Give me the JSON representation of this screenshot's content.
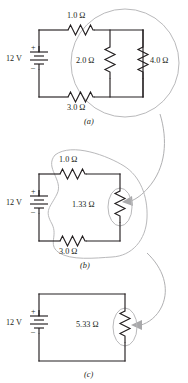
{
  "figure": {
    "colors": {
      "wire": "#231f20",
      "callout": "#b9b9bb",
      "background": "#ffffff"
    },
    "panels": [
      {
        "id": "a",
        "label": "(a)",
        "source": {
          "label": "12 V",
          "plus": "+",
          "minus": "–"
        },
        "components": [
          {
            "name": "r-series-top",
            "label": "1.0 Ω",
            "value": 1.0,
            "unit": "Ω",
            "orientation": "horizontal"
          },
          {
            "name": "r-parallel-left",
            "label": "2.0 Ω",
            "value": 2.0,
            "unit": "Ω",
            "orientation": "vertical"
          },
          {
            "name": "r-parallel-right",
            "label": "4.0 Ω",
            "value": 4.0,
            "unit": "Ω",
            "orientation": "vertical"
          },
          {
            "name": "r-series-bottom",
            "label": "3.0 Ω",
            "value": 3.0,
            "unit": "Ω",
            "orientation": "horizontal"
          }
        ],
        "highlight": {
          "shape": "circle",
          "encloses": "parallel-pair-2.0-and-4.0"
        }
      },
      {
        "id": "b",
        "label": "(b)",
        "source": {
          "label": "12 V",
          "plus": "+",
          "minus": "–"
        },
        "components": [
          {
            "name": "r-series-top",
            "label": "1.0 Ω",
            "value": 1.0,
            "unit": "Ω",
            "orientation": "horizontal"
          },
          {
            "name": "r-equivalent-parallel",
            "label": "1.33 Ω",
            "value": 1.33,
            "unit": "Ω",
            "orientation": "vertical"
          },
          {
            "name": "r-series-bottom",
            "label": "3.0 Ω",
            "value": 3.0,
            "unit": "Ω",
            "orientation": "horizontal"
          }
        ],
        "highlight": {
          "shape": "ellipse",
          "encloses": "equivalent-resistor-1.33"
        }
      },
      {
        "id": "c",
        "label": "(c)",
        "source": {
          "label": "12 V",
          "plus": "+",
          "minus": "–"
        },
        "components": [
          {
            "name": "r-equivalent-total",
            "label": "5.33 Ω",
            "value": 5.33,
            "unit": "Ω",
            "orientation": "vertical"
          }
        ],
        "highlight": {
          "shape": "ellipse",
          "encloses": "equivalent-resistor-5.33"
        }
      }
    ],
    "connectors": [
      {
        "name": "arrow-a-to-b",
        "from": "panel-a-highlight",
        "to": "panel-b-highlight"
      },
      {
        "name": "arrow-b-to-c",
        "from": "panel-b-highlight",
        "to": "panel-c-highlight"
      }
    ]
  }
}
